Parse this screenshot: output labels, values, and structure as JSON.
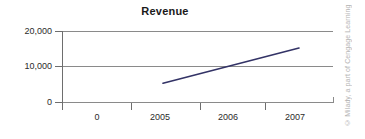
{
  "chart_data": {
    "type": "line",
    "title": "Revenue",
    "xlabel": "",
    "ylabel": "",
    "x": [
      "0",
      "2005",
      "2006",
      "2007"
    ],
    "xtick_labels": [
      "0",
      "2005",
      "2006",
      "2007"
    ],
    "ytick_labels": [
      "20,000",
      "10,000",
      "0"
    ],
    "yticks": [
      20000,
      10000,
      0
    ],
    "ylim": [
      0,
      20000
    ],
    "grid": true,
    "legend": null,
    "series": [
      {
        "name": "Revenue",
        "color": "#333366",
        "x": [
          "2005",
          "2007"
        ],
        "values": [
          5300,
          15200
        ]
      }
    ]
  },
  "figure": {
    "title": "Revenue",
    "y_labels": {
      "top": "20,000",
      "middle": "10,000",
      "bottom": "0"
    },
    "x_labels": {
      "origin": "0",
      "t1": "2005",
      "t2": "2006",
      "t3": "2007"
    },
    "credit": "© Milady, a part of Cengage Learning",
    "colors": {
      "series": "#333366",
      "grid": "#8a8a8a",
      "axis": "#6e6e6e",
      "text": "#2b2b2b",
      "credit": "#b4b4b4",
      "background": "#ffffff"
    }
  }
}
